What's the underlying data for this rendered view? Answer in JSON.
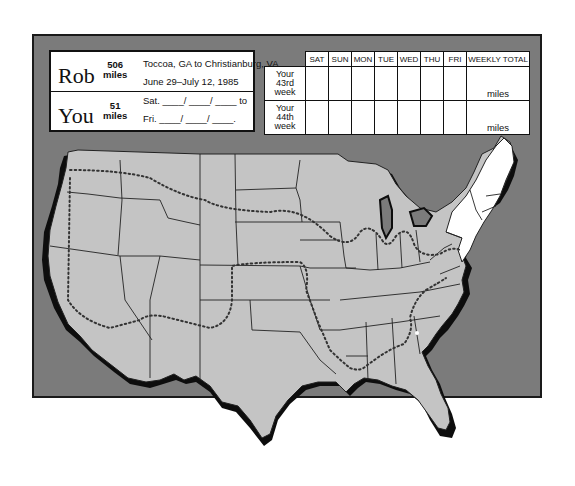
{
  "info_card": {
    "rob": {
      "name": "Rob",
      "miles_value": "506",
      "miles_unit": "miles",
      "route": "Toccoa, GA to Christianburg, VA",
      "dates": "June 29–July 12, 1985"
    },
    "you": {
      "name": "You",
      "miles_value": "51",
      "miles_unit": "miles",
      "start_line": "Sat. ____/ ____/ ____ to",
      "end_line": "Fri. ____/ ____/ ____."
    }
  },
  "log_table": {
    "columns": [
      "SAT",
      "SUN",
      "MON",
      "TUE",
      "WED",
      "THU",
      "FRI",
      "WEEKLY TOTAL"
    ],
    "rows": [
      {
        "label_lines": [
          "Your",
          "43rd",
          "week"
        ],
        "total_unit": "miles"
      },
      {
        "label_lines": [
          "Your",
          "44th",
          "week"
        ],
        "total_unit": "miles"
      }
    ]
  },
  "map": {
    "subject": "United States route map",
    "completed_region": "Northeast (NY, New England, NJ)",
    "route_style": "dotted line",
    "colors": {
      "panel": "#7b7b7b",
      "land": "#c4c4c4",
      "completed_land": "#ffffff",
      "coast_shadow": "#0d0d0d",
      "border": "#222222"
    }
  }
}
